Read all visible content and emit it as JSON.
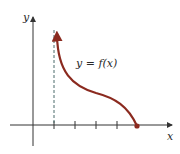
{
  "diagram": {
    "axis_labels": {
      "x": "x",
      "y": "y"
    },
    "curve_label": "y = f(x)",
    "colors": {
      "curve": "#8b2a1f",
      "axes": "#333333"
    },
    "ticks_count": 5,
    "features": {
      "vertical_asymptote": "dashed vertical line at first tick",
      "curve_start": "arrow pointing up near asymptote",
      "curve_end": "filled dot on x-axis at fifth tick"
    }
  }
}
